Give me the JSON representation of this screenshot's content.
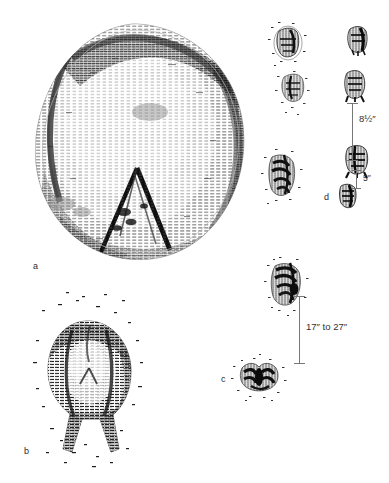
{
  "plate": {
    "title": "",
    "background_color": "#ffffff",
    "ink_color": "#1a1a1a",
    "rule_color": "#777777",
    "width": 389,
    "height": 483
  },
  "figures": [
    {
      "key": "a",
      "label": "a",
      "description": "large-oval-track-detail",
      "label_x": 33,
      "label_y": 262
    },
    {
      "key": "b",
      "label": "b",
      "description": "rounded-track-with-two-toe-drags",
      "label_x": 24,
      "label_y": 447
    },
    {
      "key": "c",
      "label": "c",
      "description": "trackway-pair-lower-right",
      "label_x": 221,
      "label_y": 375
    },
    {
      "key": "d",
      "label": "d",
      "description": "trackway-group-upper-right",
      "label_x": 324,
      "label_y": 193
    }
  ],
  "measurements": [
    {
      "key": "stride-8-5",
      "text": "8½″",
      "value": 8.5,
      "unit": "inch",
      "label_x": 359,
      "label_y": 119,
      "rule_x": 352,
      "rule_top": 103,
      "rule_bottom": 160,
      "cap_width": 11
    },
    {
      "key": "offset-5",
      "text": "5″",
      "value": 5,
      "unit": "inch",
      "label_x": 365,
      "label_y": 177,
      "rule_x": 356,
      "rule_top": 170,
      "rule_bottom": 188,
      "cap_width": 9
    },
    {
      "key": "stride-17-to-27",
      "text": "17″ to 27″",
      "value_min": 17,
      "value_max": 27,
      "unit": "inch",
      "label_x": 305,
      "label_y": 325,
      "rule_x": 299,
      "rule_top": 296,
      "rule_bottom": 363,
      "cap_width": 11
    }
  ]
}
